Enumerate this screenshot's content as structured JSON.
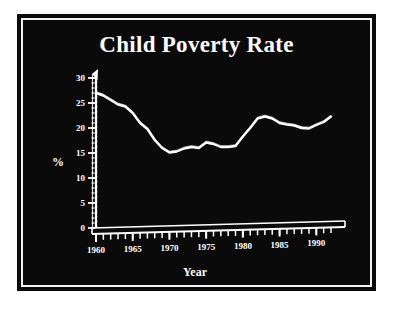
{
  "figure": {
    "background_color": "#0a0a0a",
    "ink_color": "#ffffff",
    "page_color": "#ffffff",
    "title": "Child Poverty Rate"
  },
  "axis_label_x": "Year",
  "axis_label_y": "%",
  "chart_data": {
    "type": "line",
    "title": "Child Poverty Rate",
    "xlabel": "Year",
    "ylabel": "%",
    "xlim": [
      1960,
      1992
    ],
    "ylim": [
      0,
      30
    ],
    "xticks": [
      1960,
      1965,
      1970,
      1975,
      1980,
      1985,
      1990
    ],
    "xtick_labels": [
      "1960",
      "1965",
      "1970",
      "1975",
      "1980",
      "1985",
      "1990"
    ],
    "x_minor_tick_step": 1,
    "yticks": [
      0,
      5,
      10,
      15,
      20,
      25,
      30
    ],
    "ytick_labels": [
      "0",
      "5",
      "10",
      "15",
      "20",
      "25",
      "30"
    ],
    "y_minor_tick_step": 1,
    "grid": false,
    "legend": null,
    "series": [
      {
        "name": "Child poverty rate",
        "color": "#ffffff",
        "x": [
          1960,
          1961,
          1962,
          1963,
          1964,
          1965,
          1966,
          1967,
          1968,
          1969,
          1970,
          1971,
          1972,
          1973,
          1974,
          1975,
          1976,
          1977,
          1978,
          1979,
          1980,
          1981,
          1982,
          1983,
          1984,
          1985,
          1986,
          1987,
          1988,
          1989,
          1990,
          1991,
          1992
        ],
        "values": [
          27.0,
          26.5,
          25.6,
          24.7,
          24.3,
          23.0,
          21.0,
          19.8,
          17.6,
          16.0,
          15.1,
          15.3,
          15.9,
          16.2,
          16.0,
          17.1,
          16.8,
          16.2,
          16.2,
          16.4,
          18.3,
          20.0,
          21.9,
          22.3,
          21.9,
          21.0,
          20.7,
          20.5,
          20.0,
          19.9,
          20.6,
          21.2,
          22.3
        ]
      }
    ]
  }
}
